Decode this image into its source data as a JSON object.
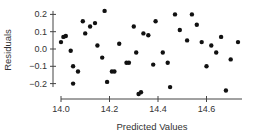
{
  "chart_data": {
    "type": "scatter",
    "title": "",
    "xlabel": "Predicted Values",
    "ylabel": "Residuals",
    "xlim": [
      14.0,
      14.75
    ],
    "ylim": [
      -0.28,
      0.24
    ],
    "x_ticks": [
      14.0,
      14.2,
      14.4,
      14.6
    ],
    "x_tick_labels": [
      "14.0",
      "14.2",
      "14.4",
      "14.6"
    ],
    "y_ticks": [
      0.2,
      0.1,
      0.0,
      -0.1,
      -0.2
    ],
    "y_tick_labels": [
      "0.2",
      "0.1",
      "0.0",
      "−0.1",
      "−0.2"
    ],
    "grid": false,
    "legend": null,
    "series": [
      {
        "name": "Residuals",
        "color": "#111111",
        "points": [
          [
            14.0,
            0.04
          ],
          [
            14.01,
            0.07
          ],
          [
            14.02,
            0.075
          ],
          [
            14.04,
            -0.01
          ],
          [
            14.05,
            -0.1
          ],
          [
            14.07,
            -0.13
          ],
          [
            14.05,
            -0.2
          ],
          [
            14.09,
            0.16
          ],
          [
            14.1,
            0.09
          ],
          [
            14.12,
            0.13
          ],
          [
            14.14,
            0.15
          ],
          [
            14.15,
            0.02
          ],
          [
            14.17,
            -0.05
          ],
          [
            14.18,
            0.22
          ],
          [
            14.19,
            -0.19
          ],
          [
            14.21,
            -0.13
          ],
          [
            14.22,
            -0.13
          ],
          [
            14.24,
            0.03
          ],
          [
            14.27,
            -0.08
          ],
          [
            14.28,
            -0.08
          ],
          [
            14.3,
            0.13
          ],
          [
            14.31,
            -0.02
          ],
          [
            14.32,
            -0.26
          ],
          [
            14.33,
            -0.25
          ],
          [
            14.34,
            0.09
          ],
          [
            14.36,
            0.08
          ],
          [
            14.38,
            -0.09
          ],
          [
            14.39,
            0.16
          ],
          [
            14.42,
            -0.02
          ],
          [
            14.44,
            -0.08
          ],
          [
            14.45,
            -0.22
          ],
          [
            14.47,
            0.2
          ],
          [
            14.49,
            0.11
          ],
          [
            14.52,
            0.05
          ],
          [
            14.54,
            0.2
          ],
          [
            14.56,
            0.14
          ],
          [
            14.58,
            0.04
          ],
          [
            14.6,
            -0.1
          ],
          [
            14.62,
            0.02
          ],
          [
            14.64,
            -0.02
          ],
          [
            14.66,
            0.07
          ],
          [
            14.68,
            -0.24
          ],
          [
            14.7,
            -0.06
          ],
          [
            14.73,
            0.04
          ]
        ]
      }
    ]
  },
  "style": {
    "axis_color": "#444444",
    "point_color": "#111111",
    "text_color": "#333333"
  }
}
